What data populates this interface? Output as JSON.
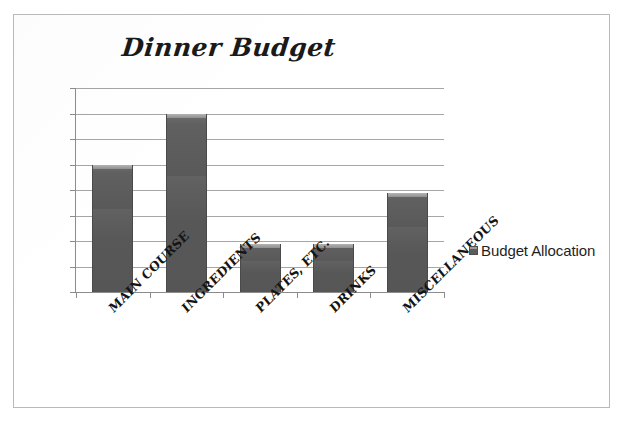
{
  "page": {
    "background_color": "#ffffff",
    "border_color": "#b9b9b9"
  },
  "chart_data": {
    "type": "bar",
    "title": "Dinner Budget",
    "xlabel": "",
    "ylabel": "",
    "categories": [
      "MAIN COURSE",
      "INGREDIENTS",
      "PLATES, ETC.",
      "DRINKS",
      "MISCELLANEOUS"
    ],
    "values": [
      25,
      35,
      9.5,
      9.5,
      19.5
    ],
    "series": [
      {
        "name": "Budget Allocation",
        "values": [
          25,
          35,
          9.5,
          9.5,
          19.5
        ],
        "color": "#5a5a5a"
      }
    ],
    "ylim": [
      0,
      40
    ],
    "ytick_step": 5,
    "ytick_labels": [
      "0",
      "5",
      "10",
      "15",
      "20",
      "25",
      "30",
      "35",
      "40"
    ],
    "grid": true,
    "grid_color": "#a6a6a6",
    "legend_position": "right",
    "legend_entries": [
      "Budget Allocation"
    ],
    "bar_color": "#5a5a5a",
    "bar_top_highlight_color": "#b4b4b4",
    "axis_color": "#8c8c8c",
    "text_color": "#141414"
  },
  "legend": {
    "label": "Budget Allocation",
    "swatch_name": "legend-color-swatch"
  }
}
